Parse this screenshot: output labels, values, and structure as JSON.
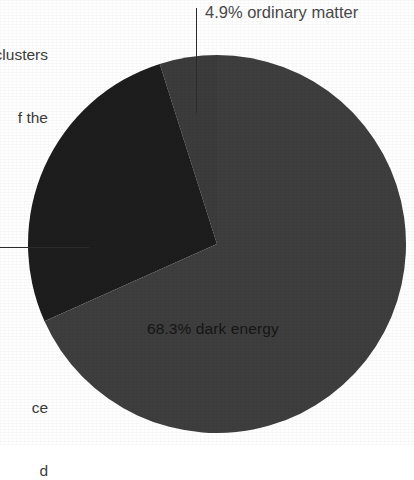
{
  "figure": {
    "kind": "pie-chart",
    "background_color": "#ffffff"
  },
  "labels": {
    "ordinary_matter": "4.9% ordinary matter",
    "dark_energy": "68.3% dark energy",
    "dark_matter_leader_only": ""
  },
  "clipped_text": {
    "top_fragments": [
      "clusters",
      "f the",
      "f",
      "ne"
    ],
    "bottom_fragments": [
      "ce",
      "d"
    ]
  },
  "chart_data": {
    "type": "pie",
    "title": "",
    "subtitle": "",
    "xlabel": "",
    "ylabel": "",
    "grid": false,
    "legend_position": "callout-labels",
    "center": [
      216,
      244
    ],
    "radius": 189,
    "start_angle_deg": -90,
    "direction": "counterclockwise",
    "categories": [
      "ordinary matter",
      "dark matter",
      "dark energy"
    ],
    "values": [
      4.9,
      26.8,
      68.3
    ],
    "value_unit": "%",
    "colors": [
      "#3e3e3e",
      "#1d1d1d",
      "#3c3c3c"
    ],
    "slices": [
      {
        "name": "ordinary matter",
        "value": 4.9,
        "label": "4.9% ordinary matter",
        "color": "#3e3e3e",
        "label_placement": "outside-top-right",
        "leader": "vertical"
      },
      {
        "name": "dark matter",
        "value": 26.8,
        "label": "",
        "color": "#1d1d1d",
        "label_placement": "outside-left-clipped",
        "leader": "horizontal"
      },
      {
        "name": "dark energy",
        "value": 68.3,
        "label": "68.3% dark energy",
        "color": "#3c3c3c",
        "label_placement": "inside-bottom",
        "leader": "none"
      }
    ],
    "annotations": [
      {
        "text": "4.9% ordinary matter",
        "target": "ordinary matter"
      },
      {
        "text": "68.3% dark energy",
        "target": "dark energy"
      }
    ]
  }
}
